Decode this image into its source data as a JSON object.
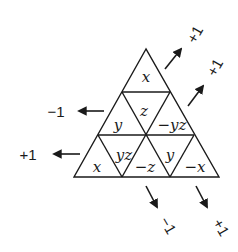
{
  "diagram": {
    "type": "triangular-grid",
    "rows": 3,
    "cells": [
      {
        "row": 0,
        "pos": "up",
        "label": "x"
      },
      {
        "row": 1,
        "pos": "up-left",
        "label": "y"
      },
      {
        "row": 1,
        "pos": "down",
        "label": "z"
      },
      {
        "row": 1,
        "pos": "up-right",
        "label": "−yz"
      },
      {
        "row": 2,
        "pos": "up-1",
        "label": "x"
      },
      {
        "row": 2,
        "pos": "down-1",
        "label": "yz"
      },
      {
        "row": 2,
        "pos": "up-2",
        "label": "−z"
      },
      {
        "row": 2,
        "pos": "down-2",
        "label": "y"
      },
      {
        "row": 2,
        "pos": "up-3",
        "label": "−x"
      }
    ],
    "arrows": {
      "left": [
        {
          "label": "−1",
          "direction": "left"
        },
        {
          "label": "+1",
          "direction": "left"
        }
      ],
      "upper_right": [
        {
          "label": "+1",
          "direction": "up-right"
        },
        {
          "label": "+1",
          "direction": "up-right"
        }
      ],
      "lower_right": [
        {
          "label": "−1",
          "direction": "down-right"
        },
        {
          "label": "+1",
          "direction": "down-right"
        }
      ]
    }
  }
}
